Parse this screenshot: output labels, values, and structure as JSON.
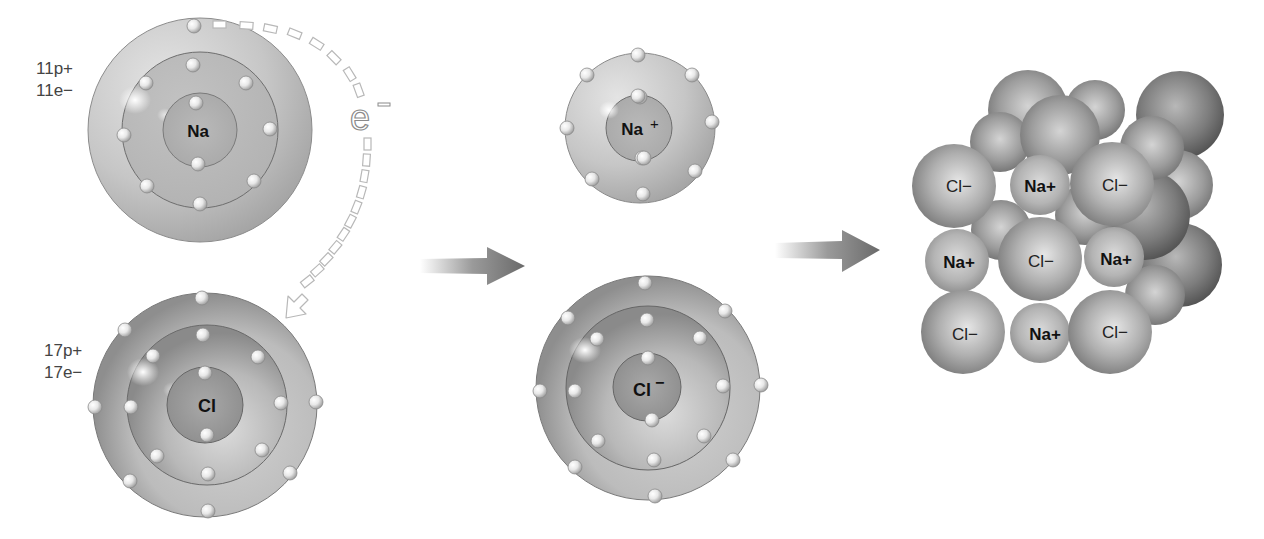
{
  "diagram": {
    "sodium_atom": {
      "symbol": "Na",
      "protons_label": "11p+",
      "electrons_label": "11e−",
      "shells": [
        2,
        8,
        1
      ]
    },
    "chlorine_atom": {
      "symbol": "Cl",
      "protons_label": "17p+",
      "electrons_label": "17e−",
      "shells": [
        2,
        8,
        7
      ]
    },
    "electron_transfer": {
      "label": "e",
      "sup": "−",
      "direction": "Na outer shell to Cl outer shell"
    },
    "sodium_ion": {
      "symbol": "Na",
      "charge": "+",
      "shells": [
        2,
        8
      ]
    },
    "chloride_ion": {
      "symbol": "Cl",
      "charge": "−",
      "shells": [
        2,
        8,
        8
      ]
    },
    "arrows": [
      "reaction-arrow-1",
      "reaction-arrow-2"
    ],
    "crystal_lattice": {
      "rows": [
        [
          "Cl−",
          "Na+",
          "Cl−"
        ],
        [
          "Na+",
          "Cl−",
          "Na+"
        ],
        [
          "Cl−",
          "Na+",
          "Cl−"
        ]
      ]
    }
  }
}
